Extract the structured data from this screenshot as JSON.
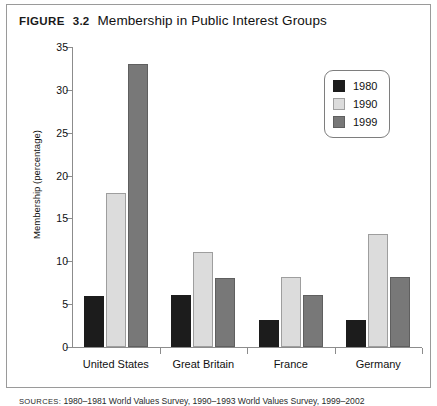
{
  "figure": {
    "label": "Figure",
    "number": "3.2",
    "title": "Membership in Public Interest Groups"
  },
  "source": {
    "label": "Sources:",
    "text": "1980–1981 World Values Survey, 1990–1993 World Values Survey, 1999–2002"
  },
  "colors": {
    "y1980": "#1c1c1c",
    "y1990": "#dcdcdc",
    "y1999": "#787878",
    "axis": "#8c8c8c",
    "frame": "#9a9a9a"
  },
  "legend": {
    "items": [
      {
        "label": "1980",
        "key": "y1980"
      },
      {
        "label": "1990",
        "key": "y1990"
      },
      {
        "label": "1999",
        "key": "y1999"
      }
    ]
  },
  "chart_data": {
    "type": "bar",
    "title": "Membership in Public Interest Groups",
    "xlabel": "",
    "ylabel": "Membership (percentage)",
    "ylim": [
      0,
      35
    ],
    "yticks": [
      0,
      5,
      10,
      15,
      20,
      25,
      30,
      35
    ],
    "ytick_labels": [
      "0",
      "5",
      "10",
      "15",
      "20",
      "25",
      "30",
      "35"
    ],
    "grid": false,
    "legend_position": "top-right",
    "categories": [
      "United States",
      "Great Britain",
      "France",
      "Germany"
    ],
    "series": [
      {
        "name": "1980",
        "color": "#1c1c1c",
        "values": [
          6.0,
          6.1,
          3.2,
          3.2
        ]
      },
      {
        "name": "1990",
        "color": "#dcdcdc",
        "values": [
          18.0,
          11.1,
          8.2,
          13.2
        ]
      },
      {
        "name": "1999",
        "color": "#787878",
        "values": [
          33.0,
          8.1,
          6.1,
          8.2
        ]
      }
    ]
  }
}
